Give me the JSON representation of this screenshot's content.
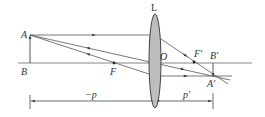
{
  "diagram": {
    "labels": {
      "lens": "L",
      "object_top": "A",
      "object_base": "B",
      "focal_left": "F",
      "optical_center": "O",
      "focal_right": "F'",
      "image_base": "B'",
      "image_top": "A'",
      "object_distance": "−p",
      "image_distance": "p'"
    },
    "colors": {
      "line": "#555555",
      "lens_fill": "#bdbdbd",
      "lens_stroke": "#333333",
      "text": "#333333"
    },
    "points": {
      "A": [
        30,
        35
      ],
      "B": [
        30,
        63
      ],
      "F": [
        114,
        63
      ],
      "O": [
        155,
        63
      ],
      "F_prime": [
        194,
        62
      ],
      "B_prime": [
        213,
        63
      ],
      "A_prime": [
        213,
        76
      ]
    }
  }
}
